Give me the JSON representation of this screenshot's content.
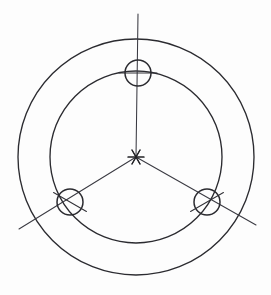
{
  "document": {
    "title": "Bolt Circle Flange Drawing",
    "view_label": "Front view",
    "drawing_type": "engineering-line-drawing",
    "background_color": "#fdfdfd",
    "line_color": "#2b2b30",
    "centerline_color": "#3a3a42"
  },
  "canvas": {
    "width": 271,
    "height": 295
  },
  "geometry": {
    "center": {
      "x": 136,
      "y": 157
    },
    "outer_circle": {
      "name": "outer-diameter",
      "cx": 136,
      "cy": 157,
      "r": 118,
      "stroke_width": 1.35
    },
    "inner_circle": {
      "name": "inner-diameter",
      "cx": 136,
      "cy": 157,
      "r": 86,
      "stroke_width": 1.35
    },
    "bolt_circle": {
      "name": "bolt-circle",
      "r": 85,
      "hole_count": 3,
      "angular_spacing_deg": 120
    },
    "holes": [
      {
        "id": "hole-top",
        "label": "Hole 1",
        "cx": 138,
        "cy": 73,
        "r": 13,
        "angle_deg": 90
      },
      {
        "id": "hole-bottom-left",
        "label": "Hole 2",
        "cx": 70,
        "cy": 202,
        "r": 13,
        "angle_deg": 210
      },
      {
        "id": "hole-bottom-right",
        "label": "Hole 3",
        "cx": 207,
        "cy": 202,
        "r": 13,
        "angle_deg": 330
      }
    ],
    "center_mark": {
      "name": "center-asterisk",
      "x": 136,
      "y": 157,
      "arm_length": 8,
      "arm_count": 6
    },
    "centerlines": [
      {
        "id": "centerline-vertical",
        "x1": 138,
        "y1": 14,
        "x2": 136,
        "y2": 157
      },
      {
        "id": "centerline-lower-left",
        "x1": 136,
        "y1": 157,
        "x2": 19,
        "y2": 229
      },
      {
        "id": "centerline-lower-right",
        "x1": 136,
        "y1": 157,
        "x2": 256,
        "y2": 225
      }
    ],
    "hole_crosshairs": [
      {
        "id": "crosshair-top",
        "cx": 138,
        "cy": 73,
        "half": 19,
        "rotation_deg": 0
      },
      {
        "id": "crosshair-bottom-left",
        "cx": 70,
        "cy": 202,
        "half": 19,
        "rotation_deg": 30
      },
      {
        "id": "crosshair-bottom-right",
        "cx": 207,
        "cy": 202,
        "half": 19,
        "rotation_deg": -30
      }
    ]
  }
}
